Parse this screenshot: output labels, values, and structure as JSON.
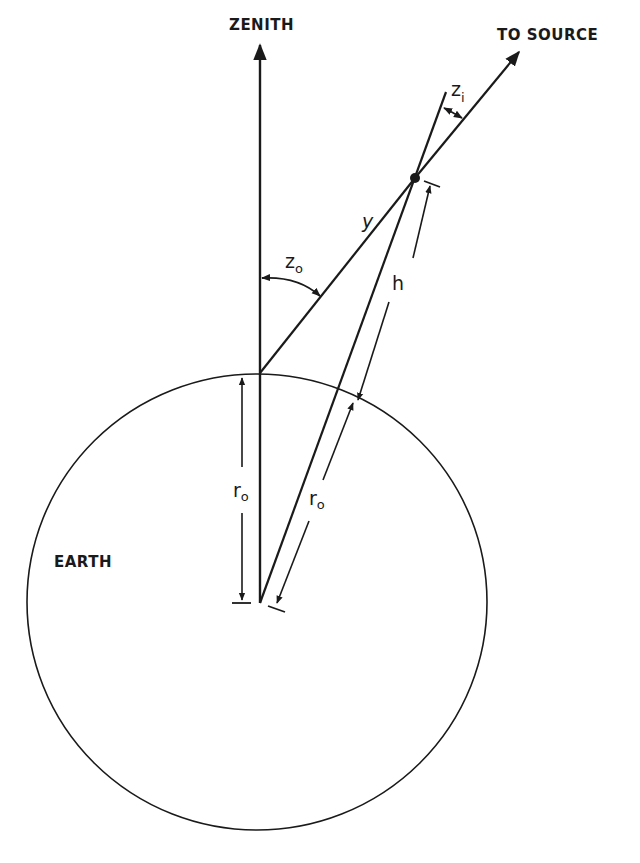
{
  "diagram": {
    "type": "geometry",
    "labels": {
      "zenith": "ZENITH",
      "source": "TO SOURCE",
      "earth": "EARTH",
      "y": "y",
      "h": "h",
      "z_o": {
        "base": "z",
        "sub": "o"
      },
      "z_i": {
        "base": "z",
        "sub": "i"
      },
      "r_o_vertical": {
        "base": "r",
        "sub": "o"
      },
      "r_o_slant": {
        "base": "r",
        "sub": "o"
      }
    },
    "colors": {
      "ink": "#1a1a1a",
      "background": "#ffffff"
    }
  }
}
